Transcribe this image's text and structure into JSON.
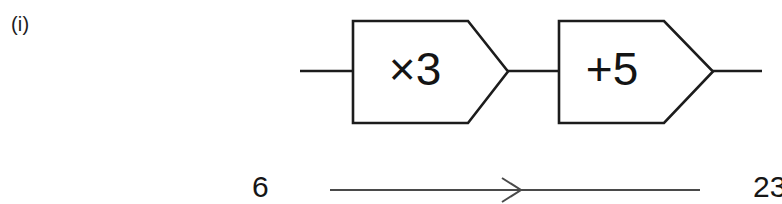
{
  "question": {
    "part_label": "(i)"
  },
  "machines": [
    {
      "operation": "×3",
      "name": "multiply-by-three"
    },
    {
      "operation": "+5",
      "name": "add-five"
    }
  ],
  "mapping": {
    "input_value": "6",
    "output_value": "23",
    "arrow": "right-arrow"
  },
  "colors": {
    "stroke": "#1c1c1c",
    "arrow_stroke": "#4a4a4a",
    "background": "#ffffff",
    "text": "#161616"
  }
}
